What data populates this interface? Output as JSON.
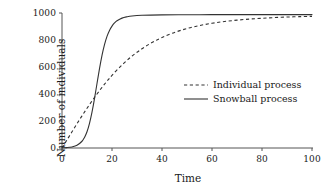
{
  "chart_data": {
    "type": "line",
    "title": "",
    "xlabel": "Time",
    "ylabel": "Number of individuals",
    "xlim": [
      0,
      100
    ],
    "ylim": [
      0,
      1000
    ],
    "xticks": [
      0,
      20,
      40,
      60,
      80,
      100
    ],
    "yticks": [
      0,
      200,
      400,
      600,
      800,
      1000
    ],
    "xtick_labels": [
      "0",
      "20",
      "40",
      "60",
      "80",
      "100"
    ],
    "ytick_labels": [
      "0",
      "200",
      "400",
      "600",
      "800",
      "1000"
    ],
    "grid": false,
    "legend_position": "center-right",
    "series": [
      {
        "name": "Individual process",
        "style": "dashed",
        "color": "#333333",
        "x": [
          0,
          2,
          4,
          6,
          8,
          10,
          12,
          14,
          16,
          18,
          20,
          24,
          28,
          32,
          36,
          40,
          45,
          50,
          55,
          60,
          65,
          70,
          75,
          80,
          85,
          90,
          95,
          100
        ],
        "y": [
          0,
          60,
          120,
          180,
          238,
          294,
          348,
          400,
          449,
          495,
          538,
          615,
          681,
          735,
          781,
          818,
          856,
          885,
          907,
          924,
          937,
          947,
          955,
          961,
          966,
          970,
          973,
          975
        ]
      },
      {
        "name": "Snowball process",
        "style": "solid",
        "color": "#333333",
        "x": [
          0,
          2,
          4,
          6,
          8,
          9,
          10,
          11,
          12,
          13,
          14,
          15,
          16,
          17,
          18,
          19,
          20,
          21,
          22,
          24,
          26,
          28,
          32,
          40,
          50,
          60,
          70,
          80,
          90,
          100
        ],
        "y": [
          1,
          3,
          8,
          20,
          50,
          78,
          120,
          182,
          265,
          366,
          478,
          588,
          686,
          766,
          827,
          871,
          903,
          926,
          942,
          962,
          972,
          978,
          983,
          986,
          987,
          988,
          988,
          988,
          988,
          988
        ]
      }
    ],
    "legend": [
      {
        "label": "Individual process",
        "style": "dashed"
      },
      {
        "label": "Snowball process",
        "style": "solid"
      }
    ]
  },
  "geometry": {
    "plot_left": 62,
    "plot_right": 312,
    "plot_top": 13,
    "plot_bottom": 148
  }
}
